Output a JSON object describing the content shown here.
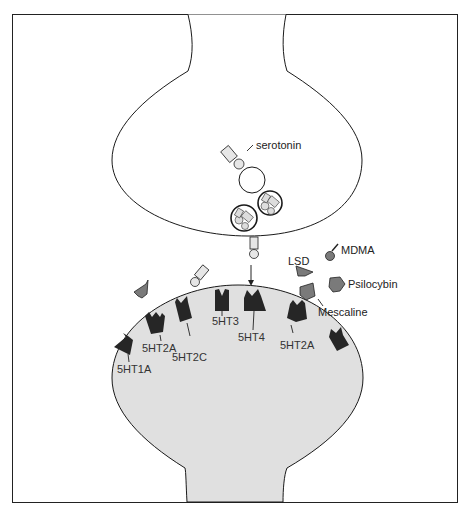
{
  "diagram": {
    "colors": {
      "outline": "#1a1a1a",
      "postsynaptic_fill": "#e0e0e0",
      "receptor_fill": "#262626",
      "drug_fill": "#7a7a7a",
      "serotonin_fill": "#e6e6e6"
    },
    "neurotransmitter_label": "serotonin",
    "receptors": [
      {
        "id": "5ht1a",
        "label": "5HT1A"
      },
      {
        "id": "5ht2a-left",
        "label": "5HT2A"
      },
      {
        "id": "5ht2c",
        "label": "5HT2C"
      },
      {
        "id": "5ht3",
        "label": "5HT3"
      },
      {
        "id": "5ht4",
        "label": "5HT4"
      },
      {
        "id": "5ht2a-right",
        "label": "5HT2A"
      }
    ],
    "drugs": [
      {
        "id": "lsd",
        "label": "LSD"
      },
      {
        "id": "mdma",
        "label": "MDMA"
      },
      {
        "id": "psilocybin",
        "label": "Psilocybin"
      },
      {
        "id": "mescaline",
        "label": "Mescaline"
      }
    ]
  }
}
